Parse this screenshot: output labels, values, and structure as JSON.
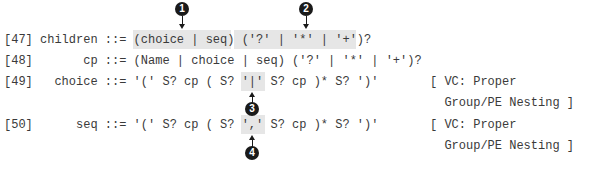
{
  "productions": [
    {
      "number": "[47]",
      "name": "children",
      "text": "[47] children ::= (choice | seq) ('?' | '*' | '+')?"
    },
    {
      "number": "[48]",
      "name": "cp",
      "text": "[48]       cp ::= (Name | choice | seq) ('?' | '*' | '+')?"
    },
    {
      "number": "[49]",
      "name": "choice",
      "text": "[49]   choice ::= '(' S? cp ( S? '|' S? cp )* S? ')'",
      "constraint": [
        "[ VC: Proper",
        "  Group/PE Nesting ]"
      ]
    },
    {
      "number": "[50]",
      "name": "seq",
      "text": "[50]      seq ::= '(' S? cp ( S? ',' S? cp )* S? ')'",
      "constraint": [
        "[ VC: Proper",
        "  Group/PE Nesting ]"
      ]
    }
  ],
  "callouts": [
    {
      "label": "1",
      "target": "(choice | seq)"
    },
    {
      "label": "2",
      "target": "('?' | '*' | '+'"
    },
    {
      "label": "3",
      "target": "'|'"
    },
    {
      "label": "4",
      "target": "','"
    }
  ],
  "colors": {
    "highlight": "#e6e6e6",
    "marker": "#1a1a1a",
    "text": "#3a3a3a"
  }
}
